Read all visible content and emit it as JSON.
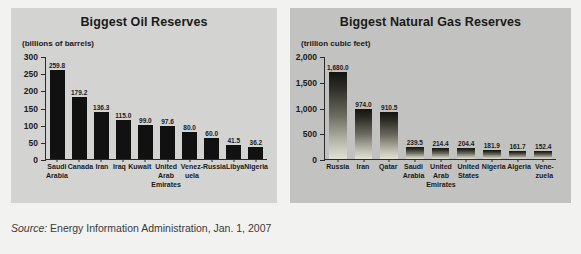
{
  "source_note": {
    "label": "Source:",
    "text": " Energy Information Administration, Jan. 1, 2007"
  },
  "colors": {
    "page_background": "#f2f2f0",
    "oil_panel_background": "#d3d3d1",
    "gas_panel_background": "#c2c2c0",
    "oil_bar": "#111111",
    "gas_bar_top": "#14140f",
    "gas_bar_bottom": "#e2e2d6",
    "axis": "#2a2a2a",
    "text": "#1a1a1a"
  },
  "chart_data": [
    {
      "id": "oil",
      "type": "bar",
      "title": "Biggest Oil Reserves",
      "subtitle": "(billions of barrels)",
      "xlabel": "",
      "ylabel": "(billions of barrels)",
      "ylim": [
        0,
        300
      ],
      "yticks": [
        0,
        50,
        100,
        150,
        200,
        250,
        300
      ],
      "ytick_labels": [
        "0",
        "50",
        "100",
        "150",
        "200",
        "250",
        "300"
      ],
      "grid": false,
      "legend": "none",
      "categories": [
        "Saudi Arabia",
        "Canada",
        "Iran",
        "Iraq",
        "Kuwait",
        "United Arab Emirates",
        "Venez-uela",
        "Russia",
        "Libya",
        "Nigeria"
      ],
      "category_lines": [
        [
          "Saudi",
          "Arabia"
        ],
        [
          "Canada"
        ],
        [
          "Iran"
        ],
        [
          "Iraq"
        ],
        [
          "Kuwait"
        ],
        [
          "United",
          "Arab",
          "Emirates"
        ],
        [
          "Venez-",
          "uela"
        ],
        [
          "Russia"
        ],
        [
          "Libya"
        ],
        [
          "Nigeria"
        ]
      ],
      "values": [
        259.8,
        179.2,
        136.3,
        115.0,
        99.0,
        97.6,
        80.0,
        60.0,
        41.5,
        36.2
      ],
      "value_labels": [
        "259.8",
        "179.2",
        "136.3",
        "115.0",
        "99.0",
        "97.6",
        "80.0",
        "60.0",
        "41.5",
        "36.2"
      ]
    },
    {
      "id": "gas",
      "type": "bar",
      "title": "Biggest Natural Gas Reserves",
      "subtitle": "(trillion cubic feet)",
      "xlabel": "",
      "ylabel": "(trillion cubic feet)",
      "ylim": [
        0,
        2000
      ],
      "yticks": [
        0,
        500,
        1000,
        1500,
        2000
      ],
      "ytick_labels": [
        "0",
        "500",
        "1,000",
        "1,500",
        "2,000"
      ],
      "grid": false,
      "legend": "none",
      "categories": [
        "Russia",
        "Iran",
        "Qatar",
        "Saudi Arabia",
        "United Arab Emirates",
        "United States",
        "Nigeria",
        "Algeria",
        "Vene-zuela"
      ],
      "category_lines": [
        [
          "Russia"
        ],
        [
          "Iran"
        ],
        [
          "Qatar"
        ],
        [
          "Saudi",
          "Arabia"
        ],
        [
          "United",
          "Arab",
          "Emirates"
        ],
        [
          "United",
          "States"
        ],
        [
          "Nigeria"
        ],
        [
          "Algeria"
        ],
        [
          "Vene-",
          "zuela"
        ]
      ],
      "values": [
        1680.0,
        974.0,
        910.5,
        239.5,
        214.4,
        204.4,
        181.9,
        161.7,
        152.4
      ],
      "value_labels": [
        "1,680.0",
        "974.0",
        "910.5",
        "239.5",
        "214.4",
        "204.4",
        "181.9",
        "161.7",
        "152.4"
      ]
    }
  ]
}
